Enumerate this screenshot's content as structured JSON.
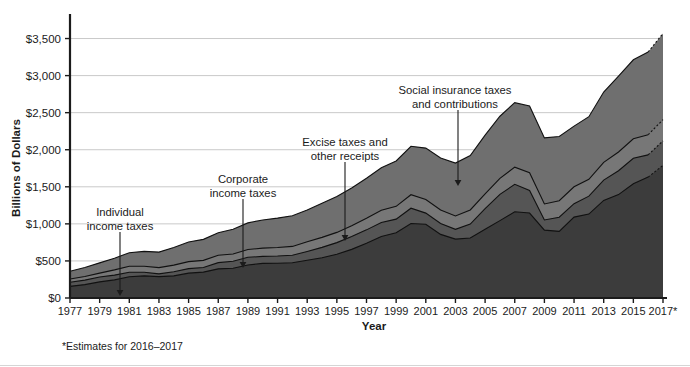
{
  "figure": {
    "footnote": "*Estimates for 2016–2017",
    "background": "#ffffff"
  },
  "chart_data": {
    "type": "area",
    "stacked": true,
    "title": "",
    "xlabel": "Year",
    "ylabel": "Billions of Dollars",
    "grid": true,
    "legend_position": "annotations-inline",
    "xlim": [
      1977,
      2017
    ],
    "ylim": [
      0,
      3750
    ],
    "ytick_values": [
      0,
      500,
      1000,
      1500,
      2000,
      2500,
      3000,
      3500
    ],
    "ytick_labels": [
      "$0",
      "$500",
      "$1,000",
      "$1,500",
      "$2,000",
      "$2,500",
      "$3,000",
      "$3,500"
    ],
    "xtick_values": [
      1977,
      1979,
      1981,
      1983,
      1985,
      1987,
      1989,
      1991,
      1993,
      1995,
      1997,
      1999,
      2001,
      2003,
      2005,
      2007,
      2009,
      2011,
      2013,
      2015,
      2017
    ],
    "xtick_labels": [
      "1977",
      "1979",
      "1981",
      "1983",
      "1985",
      "1987",
      "1989",
      "1991",
      "1993",
      "1995",
      "1997",
      "1999",
      "2001",
      "2003",
      "2005",
      "2007",
      "2009",
      "2011",
      "2013",
      "2015",
      "2017*"
    ],
    "x": [
      1977,
      1978,
      1979,
      1980,
      1981,
      1982,
      1983,
      1984,
      1985,
      1986,
      1987,
      1988,
      1989,
      1990,
      1991,
      1992,
      1993,
      1994,
      1995,
      1996,
      1997,
      1998,
      1999,
      2000,
      2001,
      2002,
      2003,
      2004,
      2005,
      2006,
      2007,
      2008,
      2009,
      2010,
      2011,
      2012,
      2013,
      2014,
      2015,
      2016,
      2017
    ],
    "estimate_from": 2016,
    "series": [
      {
        "name": "Individual income taxes",
        "color": "#3c3c3c",
        "values": [
          157,
          181,
          217,
          244,
          286,
          298,
          289,
          298,
          335,
          349,
          393,
          401,
          446,
          467,
          468,
          476,
          510,
          543,
          590,
          656,
          737,
          829,
          879,
          1004,
          994,
          858,
          794,
          809,
          927,
          1044,
          1163,
          1146,
          915,
          899,
          1091,
          1132,
          1316,
          1395,
          1541,
          1631,
          1790
        ]
      },
      {
        "name": "Corporate income taxes",
        "color": "#555555",
        "values": [
          55,
          60,
          66,
          65,
          61,
          49,
          37,
          56,
          61,
          63,
          84,
          94,
          103,
          94,
          98,
          100,
          118,
          140,
          157,
          172,
          182,
          189,
          185,
          207,
          151,
          148,
          132,
          189,
          278,
          354,
          370,
          304,
          138,
          191,
          181,
          242,
          274,
          321,
          344,
          300,
          330
        ]
      },
      {
        "name": "Excise taxes and other receipts",
        "color": "#777777",
        "values": [
          44,
          49,
          53,
          70,
          81,
          81,
          84,
          89,
          95,
          96,
          100,
          99,
          105,
          112,
          116,
          120,
          131,
          135,
          138,
          147,
          157,
          166,
          172,
          182,
          183,
          181,
          181,
          190,
          198,
          216,
          232,
          241,
          216,
          223,
          228,
          227,
          240,
          254,
          263,
          272,
          285
        ]
      },
      {
        "name": "Social insurance taxes and contributions",
        "color": "#6f6f6f",
        "values": [
          106,
          121,
          138,
          158,
          183,
          201,
          209,
          239,
          265,
          283,
          303,
          334,
          359,
          380,
          396,
          414,
          428,
          461,
          484,
          509,
          539,
          572,
          612,
          653,
          694,
          701,
          713,
          733,
          794,
          838,
          870,
          900,
          891,
          865,
          819,
          845,
          948,
          1023,
          1065,
          1115,
          1164
        ]
      }
    ],
    "annotations": [
      {
        "id": "individual-income-taxes",
        "label_lines": [
          "Individual",
          "income taxes"
        ],
        "target_series": "Individual income taxes",
        "text_x": 120,
        "text_y": 216,
        "arrow_x": 120,
        "arrow_y0": 232,
        "arrow_y1": 296
      },
      {
        "id": "corporate-income-taxes",
        "label_lines": [
          "Corporate",
          "income taxes"
        ],
        "target_series": "Corporate income taxes",
        "text_x": 243,
        "text_y": 183,
        "arrow_x": 243,
        "arrow_y0": 199,
        "arrow_y1": 268
      },
      {
        "id": "excise-taxes-and-other-receipts",
        "label_lines": [
          "Excise taxes and",
          "other receipts"
        ],
        "target_series": "Excise taxes and other receipts",
        "text_x": 345,
        "text_y": 146,
        "arrow_x": 345,
        "arrow_y0": 162,
        "arrow_y1": 241
      },
      {
        "id": "social-insurance-taxes-and-contributions",
        "label_lines": [
          "Social insurance taxes",
          "and contributions"
        ],
        "target_series": "Social insurance taxes and contributions",
        "text_x": 455,
        "text_y": 94,
        "arrow_x": 458,
        "arrow_y0": 110,
        "arrow_y1": 186
      }
    ]
  }
}
